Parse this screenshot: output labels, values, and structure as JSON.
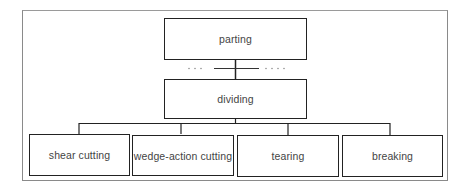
{
  "diagram": {
    "root": {
      "label": "parting"
    },
    "intermediate": {
      "label": "dividing"
    },
    "connector_dots_left": ". . .",
    "connector_dots_right": ". . . .",
    "children": [
      {
        "label": "shear cutting"
      },
      {
        "label": "wedge-action cutting"
      },
      {
        "label": "tearing"
      },
      {
        "label": "breaking"
      }
    ]
  },
  "colors": {
    "line": "#222222",
    "frame": "#8a8a8a",
    "text": "#444444"
  }
}
